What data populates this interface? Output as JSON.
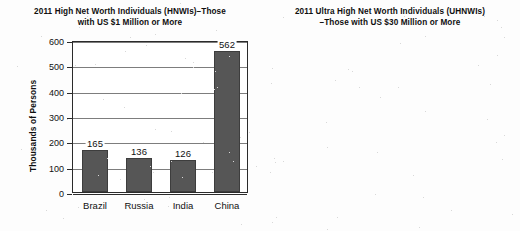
{
  "chart_data": [
    {
      "id": "hnwi",
      "type": "bar",
      "title_line1": "2011 High Net Worth Individuals (HNWIs)–Those",
      "title_line2": "with US $1 Million or More",
      "xlabel": "",
      "ylabel": "Thousands of Persons",
      "categories": [
        "Brazil",
        "Russia",
        "India",
        "China"
      ],
      "values": [
        165,
        136,
        126,
        562
      ],
      "value_labels": [
        "165",
        "136",
        "126",
        "562"
      ],
      "bar_draw_values": [
        165,
        136,
        126,
        558
      ],
      "ylim": [
        0,
        600
      ],
      "yticks": [
        0,
        100,
        200,
        300,
        400,
        500,
        600
      ],
      "ytick_labels": [
        "0",
        "100",
        "200",
        "300",
        "400",
        "500",
        "600"
      ],
      "grid": true,
      "legend": "none",
      "bar_color": "#565656"
    },
    {
      "id": "uhnwi",
      "type": "bar",
      "title_line1": "2011 Ultra High Net Worth Individuals (UHNWIs)",
      "title_line2": "–Those with US $30 Million or More",
      "xlabel": "",
      "ylabel": "Thousands of Persons",
      "categories": [
        "Brazil",
        "Russia",
        "India",
        "China"
      ],
      "values": [
        4.7,
        1.3,
        8.2,
        562
      ],
      "value_labels": [
        "4.7",
        "1.3",
        "8.2",
        "562"
      ],
      "bar_draw_values": [
        4.6,
        1.2,
        8.1,
        13.0
      ],
      "ylim": [
        0,
        15
      ],
      "yticks": [
        0,
        2,
        4,
        6,
        8,
        10,
        12,
        14
      ],
      "ytick_labels": [
        "0",
        "2",
        "4",
        "6",
        "8",
        "10",
        "12",
        "14"
      ],
      "grid": true,
      "legend": "none",
      "bar_color": "#565656"
    }
  ]
}
